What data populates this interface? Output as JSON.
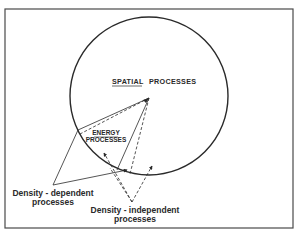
{
  "diagram": {
    "spatial_label_underlined": "SPATIAL",
    "spatial_label_rest": "PROCESSES",
    "energy_label_line1": "ENERGY",
    "energy_label_line2": "PROCESSES",
    "density_dependent_line1": "Density - dependent",
    "density_dependent_line2": "processes",
    "density_independent_line1": "Density - independent",
    "density_independent_line2": "processes"
  },
  "colors": {
    "ink": "#2a2a2a",
    "background": "#ffffff",
    "frame": "#4a4a4a"
  }
}
